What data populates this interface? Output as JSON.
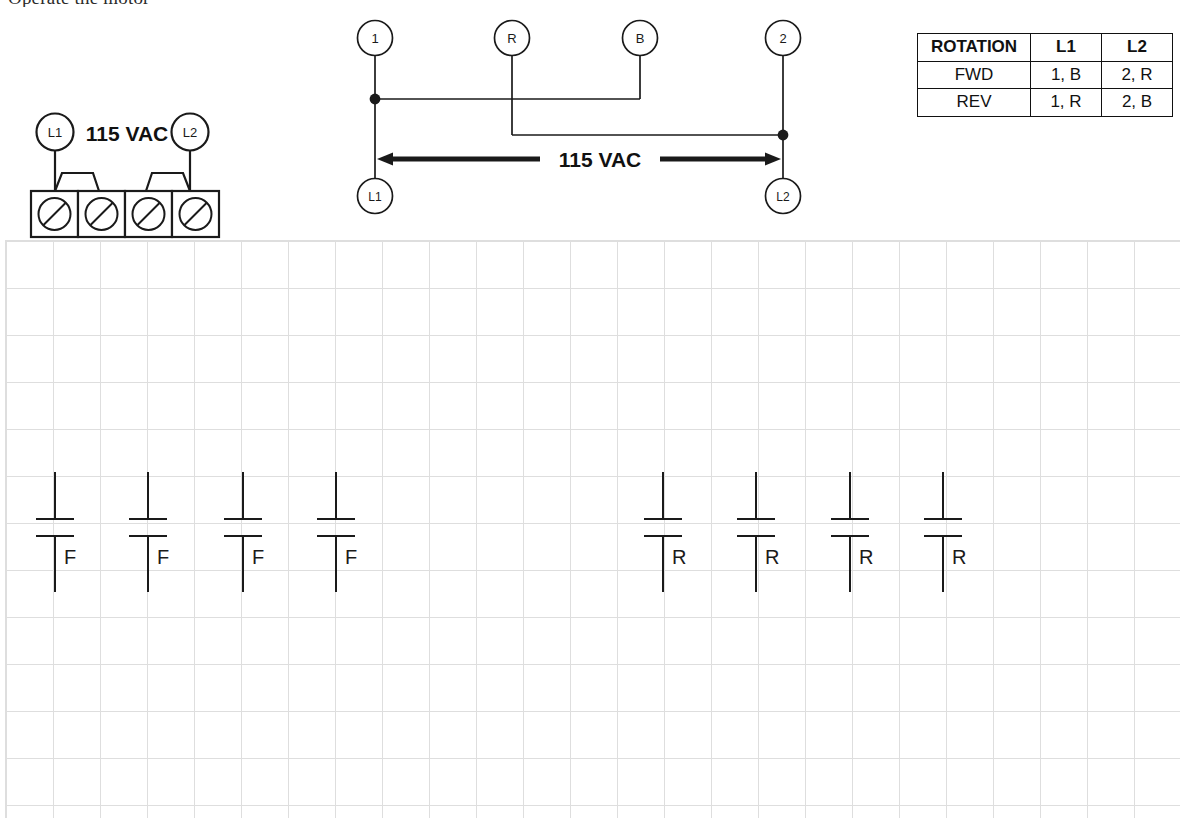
{
  "heading": {
    "clipped_text": "Operate the motor"
  },
  "supply_block": {
    "left_terminal_label": "L1",
    "voltage_label": "115 VAC",
    "right_terminal_label": "L2",
    "screw_count": 4
  },
  "wiring_diagram": {
    "top_terminals": [
      {
        "label": "1",
        "x": 375
      },
      {
        "label": "R",
        "x": 512
      },
      {
        "label": "B",
        "x": 640
      },
      {
        "label": "2",
        "x": 783
      }
    ],
    "bottom_terminals": [
      {
        "label": "L1",
        "x": 375
      },
      {
        "label": "L2",
        "x": 783
      }
    ],
    "voltage_label": "115 VAC"
  },
  "rotation_table": {
    "headers": [
      "ROTATION",
      "L1",
      "L2"
    ],
    "rows": [
      {
        "rotation": "FWD",
        "l1": "1, B",
        "l2": "2, R"
      },
      {
        "rotation": "REV",
        "l1": "1, R",
        "l2": "2, B"
      }
    ]
  },
  "contacts": {
    "forward": [
      {
        "label": "F",
        "x": 55
      },
      {
        "label": "F",
        "x": 148
      },
      {
        "label": "F",
        "x": 243
      },
      {
        "label": "F",
        "x": 336
      }
    ],
    "reverse": [
      {
        "label": "R",
        "x": 663
      },
      {
        "label": "R",
        "x": 756
      },
      {
        "label": "R",
        "x": 850
      },
      {
        "label": "R",
        "x": 943
      }
    ]
  },
  "colors": {
    "ink": "#1a1a1a",
    "grid_line": "#d9d9d9",
    "table_border": "#111111",
    "paper": "#ffffff"
  }
}
